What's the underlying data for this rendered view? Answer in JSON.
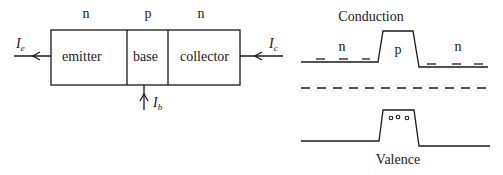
{
  "transistor": {
    "regions": [
      {
        "type_label": "n",
        "name": "emitter"
      },
      {
        "type_label": "p",
        "name": "base"
      },
      {
        "type_label": "n",
        "name": "collector"
      }
    ],
    "currents": {
      "emitter": {
        "symbol": "I",
        "subscript": "e"
      },
      "base": {
        "symbol": "I",
        "subscript": "b"
      },
      "collector": {
        "symbol": "I",
        "subscript": "c"
      }
    }
  },
  "band_diagram": {
    "conduction_label": "Conduction",
    "valence_label": "Valence",
    "regions": [
      "n",
      "p",
      "n"
    ],
    "carriers": {
      "conduction": "electrons (dashes) in n regions",
      "valence": "holes (circles) in p region"
    }
  }
}
